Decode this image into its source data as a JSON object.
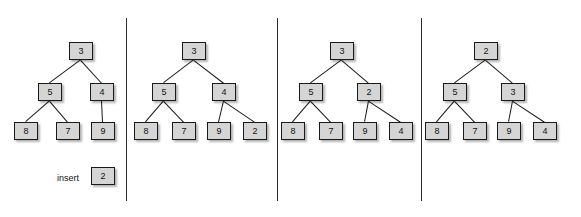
{
  "figure": {
    "background_color": "#ffffff",
    "node_fill_color": "#d5d5d5",
    "node_border_color": "#1a1a1a",
    "edge_color": "#1b1b1b",
    "divider_color": "#2b2b2b",
    "text_color": "#111111"
  },
  "dividers": [
    {
      "x": 126,
      "y": 18,
      "height": 183
    },
    {
      "x": 277,
      "y": 18,
      "height": 183
    },
    {
      "x": 421,
      "y": 18,
      "height": 183
    }
  ],
  "panels": [
    {
      "id": "panel-1",
      "caption": "initial heap with pending insert",
      "insert": {
        "label": "insert",
        "label_x": 57,
        "label_y": 174,
        "value": "2",
        "node_x": 91,
        "node_y": 167
      },
      "nodes": [
        {
          "id": "p1-root",
          "value": "3",
          "x": 69,
          "y": 42,
          "w": 24,
          "h": 18
        },
        {
          "id": "p1-l",
          "value": "5",
          "x": 38,
          "y": 83,
          "w": 24,
          "h": 18
        },
        {
          "id": "p1-r",
          "value": "4",
          "x": 90,
          "y": 83,
          "w": 24,
          "h": 18
        },
        {
          "id": "p1-ll",
          "value": "8",
          "x": 14,
          "y": 122,
          "w": 24,
          "h": 18
        },
        {
          "id": "p1-lr",
          "value": "7",
          "x": 56,
          "y": 122,
          "w": 24,
          "h": 18
        },
        {
          "id": "p1-rl",
          "value": "9",
          "x": 91,
          "y": 122,
          "w": 24,
          "h": 18
        }
      ],
      "edges": [
        {
          "from": "p1-root",
          "to": "p1-l"
        },
        {
          "from": "p1-root",
          "to": "p1-r"
        },
        {
          "from": "p1-l",
          "to": "p1-ll"
        },
        {
          "from": "p1-l",
          "to": "p1-lr"
        },
        {
          "from": "p1-r",
          "to": "p1-rl"
        }
      ]
    },
    {
      "id": "panel-2",
      "caption": "2 appended as last leaf",
      "insert": null,
      "nodes": [
        {
          "id": "p2-root",
          "value": "3",
          "x": 182,
          "y": 42,
          "w": 24,
          "h": 18
        },
        {
          "id": "p2-l",
          "value": "5",
          "x": 152,
          "y": 83,
          "w": 24,
          "h": 18
        },
        {
          "id": "p2-r",
          "value": "4",
          "x": 212,
          "y": 83,
          "w": 24,
          "h": 18
        },
        {
          "id": "p2-ll",
          "value": "8",
          "x": 134,
          "y": 122,
          "w": 24,
          "h": 18
        },
        {
          "id": "p2-lr",
          "value": "7",
          "x": 172,
          "y": 122,
          "w": 24,
          "h": 18
        },
        {
          "id": "p2-rl",
          "value": "9",
          "x": 207,
          "y": 122,
          "w": 24,
          "h": 18
        },
        {
          "id": "p2-rr",
          "value": "2",
          "x": 243,
          "y": 122,
          "w": 24,
          "h": 18
        }
      ],
      "edges": [
        {
          "from": "p2-root",
          "to": "p2-l"
        },
        {
          "from": "p2-root",
          "to": "p2-r"
        },
        {
          "from": "p2-l",
          "to": "p2-ll"
        },
        {
          "from": "p2-l",
          "to": "p2-lr"
        },
        {
          "from": "p2-r",
          "to": "p2-rl"
        },
        {
          "from": "p2-r",
          "to": "p2-rr"
        }
      ]
    },
    {
      "id": "panel-3",
      "caption": "2 swapped up past 4",
      "insert": null,
      "nodes": [
        {
          "id": "p3-root",
          "value": "3",
          "x": 330,
          "y": 42,
          "w": 24,
          "h": 18
        },
        {
          "id": "p3-l",
          "value": "5",
          "x": 299,
          "y": 83,
          "w": 24,
          "h": 18
        },
        {
          "id": "p3-r",
          "value": "2",
          "x": 357,
          "y": 83,
          "w": 24,
          "h": 18
        },
        {
          "id": "p3-ll",
          "value": "8",
          "x": 281,
          "y": 122,
          "w": 24,
          "h": 18
        },
        {
          "id": "p3-lr",
          "value": "7",
          "x": 319,
          "y": 122,
          "w": 24,
          "h": 18
        },
        {
          "id": "p3-rl",
          "value": "9",
          "x": 353,
          "y": 122,
          "w": 24,
          "h": 18
        },
        {
          "id": "p3-rr",
          "value": "4",
          "x": 389,
          "y": 122,
          "w": 24,
          "h": 18
        }
      ],
      "edges": [
        {
          "from": "p3-root",
          "to": "p3-l"
        },
        {
          "from": "p3-root",
          "to": "p3-r"
        },
        {
          "from": "p3-l",
          "to": "p3-ll"
        },
        {
          "from": "p3-l",
          "to": "p3-lr"
        },
        {
          "from": "p3-r",
          "to": "p3-rl"
        },
        {
          "from": "p3-r",
          "to": "p3-rr"
        }
      ]
    },
    {
      "id": "panel-4",
      "caption": "2 swapped up past 3 to root",
      "insert": null,
      "nodes": [
        {
          "id": "p4-root",
          "value": "2",
          "x": 474,
          "y": 42,
          "w": 24,
          "h": 18
        },
        {
          "id": "p4-l",
          "value": "5",
          "x": 443,
          "y": 83,
          "w": 24,
          "h": 18
        },
        {
          "id": "p4-r",
          "value": "3",
          "x": 501,
          "y": 83,
          "w": 24,
          "h": 18
        },
        {
          "id": "p4-ll",
          "value": "8",
          "x": 425,
          "y": 122,
          "w": 24,
          "h": 18
        },
        {
          "id": "p4-lr",
          "value": "7",
          "x": 463,
          "y": 122,
          "w": 24,
          "h": 18
        },
        {
          "id": "p4-rl",
          "value": "9",
          "x": 497,
          "y": 122,
          "w": 24,
          "h": 18
        },
        {
          "id": "p4-rr",
          "value": "4",
          "x": 533,
          "y": 122,
          "w": 24,
          "h": 18
        }
      ],
      "edges": [
        {
          "from": "p4-root",
          "to": "p4-l"
        },
        {
          "from": "p4-root",
          "to": "p4-r"
        },
        {
          "from": "p4-l",
          "to": "p4-ll"
        },
        {
          "from": "p4-l",
          "to": "p4-lr"
        },
        {
          "from": "p4-r",
          "to": "p4-rl"
        },
        {
          "from": "p4-r",
          "to": "p4-rr"
        }
      ]
    }
  ]
}
